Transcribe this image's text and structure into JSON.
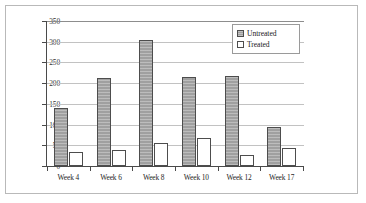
{
  "chart_data": {
    "type": "bar",
    "title": "",
    "xlabel": "",
    "ylabel": "c-DCE Concentration (mg/L)",
    "categories": [
      "Week 4",
      "Week 6",
      "Week 8",
      "Week 10",
      "Week 12",
      "Week 17"
    ],
    "series": [
      {
        "name": "Untreated",
        "values": [
          140,
          212,
          305,
          216,
          217,
          94
        ],
        "color": "#a0a0a0"
      },
      {
        "name": "Treated",
        "values": [
          33,
          38,
          55,
          68,
          26,
          44
        ],
        "color": "#ffffff"
      }
    ],
    "ylim": [
      0,
      350
    ],
    "ytick_values": [
      0,
      50,
      100,
      150,
      200,
      250,
      300,
      350
    ],
    "ytick_labels": [
      "0",
      "50",
      "100",
      "150",
      "200",
      "250",
      "300",
      "350"
    ],
    "grid": true,
    "legend_position": "top-right",
    "legend_entries": [
      "Untreated",
      "Treated"
    ]
  }
}
